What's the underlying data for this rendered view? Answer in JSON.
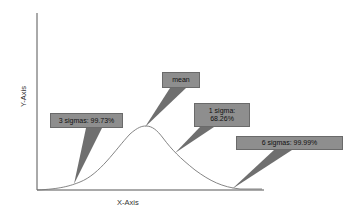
{
  "diagram": {
    "type": "normal-distribution-callout-diagram",
    "x_axis_label": "X-Axis",
    "y_axis_label": "Y-Axis",
    "callouts": [
      {
        "id": "mean",
        "text": "mean"
      },
      {
        "id": "three_sigma",
        "text": "3 sigmas: 99.73%"
      },
      {
        "id": "one_sigma",
        "line1": "1 sigma:",
        "line2": "68.26%"
      },
      {
        "id": "six_sigma",
        "text": "6 sigmas: 99.99%"
      }
    ],
    "colors": {
      "callout_fill": "#8e8e8e",
      "pointer_fill": "#6f6f6f",
      "axis": "#555555",
      "curve": "#777777",
      "background": "#ffffff"
    }
  }
}
